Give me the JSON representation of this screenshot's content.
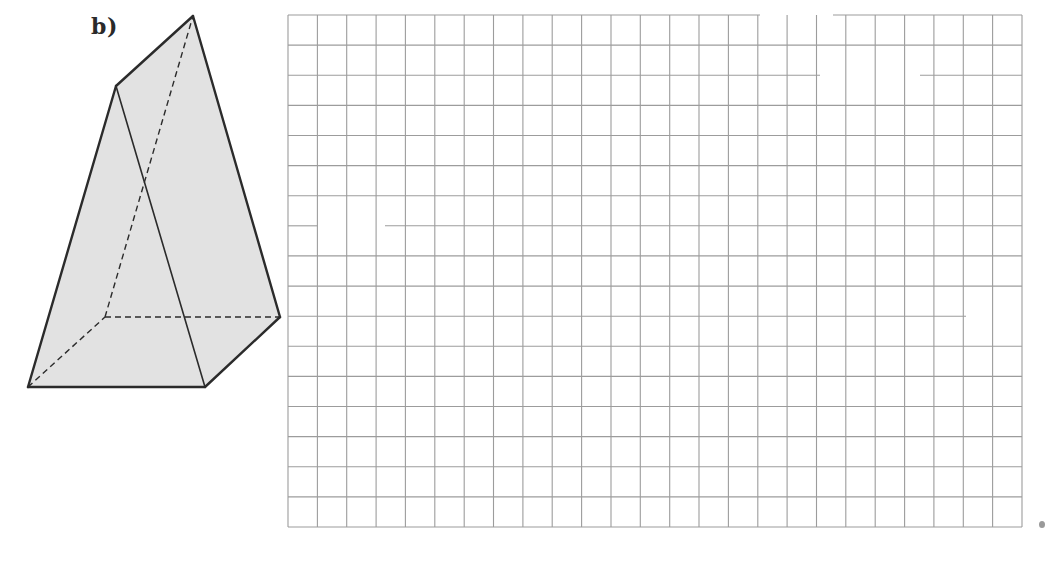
{
  "figure": {
    "label": "b)",
    "prism": {
      "fill_color": "#e2e2e2",
      "edge_color": "#2b2b2b",
      "vertices": {
        "front_bottom_left": [
          28,
          387
        ],
        "front_bottom_right": [
          205,
          387
        ],
        "back_bottom_left": [
          105,
          317
        ],
        "back_bottom_right": [
          280,
          317
        ],
        "front_top": [
          116,
          86
        ],
        "back_top": [
          193,
          16
        ]
      },
      "solid_edges": [
        [
          "front_bottom_left",
          "front_bottom_right"
        ],
        [
          "front_bottom_right",
          "back_bottom_right"
        ],
        [
          "back_bottom_right",
          "back_top"
        ],
        [
          "back_top",
          "front_top"
        ],
        [
          "front_top",
          "front_bottom_left"
        ],
        [
          "front_top",
          "front_bottom_right"
        ]
      ],
      "dashed_edges": [
        [
          "front_bottom_left",
          "back_bottom_left"
        ],
        [
          "back_bottom_left",
          "back_bottom_right"
        ],
        [
          "back_bottom_left",
          "back_top"
        ]
      ]
    }
  },
  "grid": {
    "columns": 25,
    "rows": 17,
    "left": 288,
    "top": 15,
    "right": 1022,
    "bottom": 527,
    "line_color": "#9c9c9c",
    "gaps": [
      {
        "row_line": 0,
        "from_x": 760,
        "to_x": 833
      },
      {
        "row_line": 2,
        "from_x": 820,
        "to_x": 920
      },
      {
        "row_line": 7,
        "from_x": 317,
        "to_x": 385
      },
      {
        "row_line": 10,
        "from_x": 966,
        "to_x": 1022
      }
    ]
  },
  "page_mark": {
    "color": "#9a9a9a"
  }
}
